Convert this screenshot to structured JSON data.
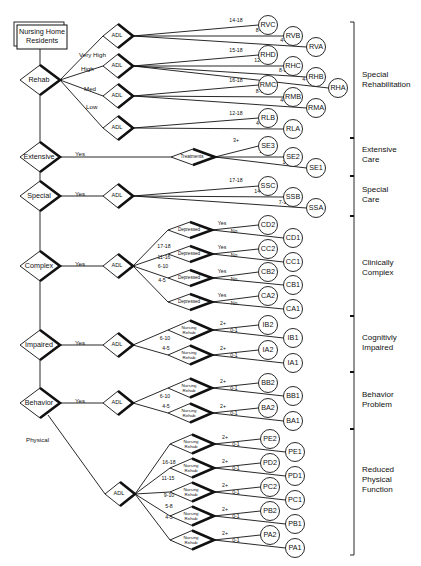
{
  "title_lines": [
    "Nursing Home",
    "Residents"
  ],
  "colors": {
    "line": "#111111",
    "background": "#ffffff"
  },
  "main_nodes": [
    {
      "id": "rehab",
      "label": "Rehab",
      "x": 40,
      "y": 80
    },
    {
      "id": "extensive",
      "label": "Extensive",
      "x": 40,
      "y": 157
    },
    {
      "id": "special",
      "label": "Special",
      "x": 40,
      "y": 196
    },
    {
      "id": "complex",
      "label": "Complex",
      "x": 40,
      "y": 266
    },
    {
      "id": "impaired",
      "label": "Impaired",
      "x": 40,
      "y": 345
    },
    {
      "id": "behavior",
      "label": "Behavior",
      "x": 40,
      "y": 403
    }
  ],
  "edge_labels": [
    {
      "text": "Very High",
      "x": 79,
      "y": 55
    },
    {
      "text": "High",
      "x": 81,
      "y": 69
    },
    {
      "text": "Med",
      "x": 84,
      "y": 89
    },
    {
      "text": "Low",
      "x": 86,
      "y": 107
    },
    {
      "text": "Yes",
      "x": 75,
      "y": 154
    },
    {
      "text": "Yes",
      "x": 75,
      "y": 194
    },
    {
      "text": "Yes",
      "x": 75,
      "y": 264
    },
    {
      "text": "Yes",
      "x": 75,
      "y": 343
    },
    {
      "text": "Yes",
      "x": 75,
      "y": 401
    },
    {
      "text": "Physical",
      "x": 26,
      "y": 440
    }
  ],
  "adl_nodes": [
    {
      "label": "ADL",
      "x": 118,
      "y": 36
    },
    {
      "label": "ADL",
      "x": 118,
      "y": 66
    },
    {
      "label": "ADL",
      "x": 118,
      "y": 96
    },
    {
      "label": "ADL",
      "x": 118,
      "y": 128
    },
    {
      "label": "ADL",
      "x": 118,
      "y": 196
    },
    {
      "label": "ADL",
      "x": 118,
      "y": 266
    },
    {
      "label": "ADL",
      "x": 118,
      "y": 345
    },
    {
      "label": "ADL",
      "x": 118,
      "y": 403
    },
    {
      "label": "ADL",
      "x": 120,
      "y": 494
    }
  ],
  "rehab_groups": [
    {
      "adl": 0,
      "outcomes": [
        {
          "code": "RVC",
          "range": "14-18",
          "x": 268,
          "y": 25
        },
        {
          "code": "RVB",
          "range": "8-13",
          "x": 293,
          "y": 36
        },
        {
          "code": "RVA",
          "range": "4-7",
          "x": 316,
          "y": 47
        }
      ]
    },
    {
      "adl": 1,
      "outcomes": [
        {
          "code": "RHD",
          "range": "15-18",
          "x": 268,
          "y": 55
        },
        {
          "code": "RHC",
          "range": "12-14",
          "x": 293,
          "y": 66
        },
        {
          "code": "RHB",
          "range": "8-11",
          "x": 316,
          "y": 77
        },
        {
          "code": "RHA",
          "range": "4-7",
          "x": 338,
          "y": 88
        }
      ]
    },
    {
      "adl": 2,
      "outcomes": [
        {
          "code": "RMC",
          "range": "16-18",
          "x": 268,
          "y": 85
        },
        {
          "code": "RMB",
          "range": "8-15",
          "x": 293,
          "y": 97
        },
        {
          "code": "RMA",
          "range": "4-7",
          "x": 316,
          "y": 108
        }
      ]
    },
    {
      "adl": 3,
      "outcomes": [
        {
          "code": "RLB",
          "range": "12-18",
          "x": 268,
          "y": 118
        },
        {
          "code": "RLA",
          "range": "4-11",
          "x": 293,
          "y": 129
        }
      ]
    }
  ],
  "extensive": {
    "node": {
      "label": "Treatments",
      "x": 193,
      "y": 157
    },
    "outcomes": [
      {
        "code": "SE3",
        "range": "3+",
        "x": 268,
        "y": 146
      },
      {
        "code": "SE2",
        "range": "2",
        "x": 293,
        "y": 157
      },
      {
        "code": "SE1",
        "range": "1",
        "x": 316,
        "y": 168
      }
    ]
  },
  "special": {
    "outcomes": [
      {
        "code": "SSC",
        "range": "17-18",
        "x": 268,
        "y": 186
      },
      {
        "code": "SSB",
        "range": "14-16",
        "x": 293,
        "y": 197
      },
      {
        "code": "SSA",
        "range": "7-13",
        "x": 316,
        "y": 208
      }
    ]
  },
  "complex": {
    "branches": [
      {
        "range": "17-18",
        "node": "Depressed",
        "x": 190,
        "y": 230,
        "yes": {
          "code": "CD2",
          "x": 268,
          "y": 225
        },
        "no": {
          "code": "CD1",
          "x": 293,
          "y": 238
        }
      },
      {
        "range": "11-16",
        "node": "Depressed",
        "x": 190,
        "y": 254,
        "yes": {
          "code": "CC2",
          "x": 268,
          "y": 249
        },
        "no": {
          "code": "CC1",
          "x": 293,
          "y": 262
        }
      },
      {
        "range": "6-10",
        "node": "Depressed",
        "x": 190,
        "y": 278,
        "yes": {
          "code": "CB2",
          "x": 268,
          "y": 272
        },
        "no": {
          "code": "CB1",
          "x": 293,
          "y": 285
        }
      },
      {
        "range": "4-5",
        "node": "Depressed",
        "x": 190,
        "y": 302,
        "yes": {
          "code": "CA2",
          "x": 268,
          "y": 296
        },
        "no": {
          "code": "CA1",
          "x": 293,
          "y": 309
        }
      }
    ],
    "yes_label": "Yes",
    "no_label": "No"
  },
  "impaired": {
    "branches": [
      {
        "range": "6-10",
        "node": [
          "Nursing",
          "Rehab"
        ],
        "x": 190,
        "y": 330,
        "hi": {
          "code": "IB2",
          "label": "2+",
          "x": 268,
          "y": 325
        },
        "lo": {
          "code": "IB1",
          "label": "0-1",
          "x": 293,
          "y": 338
        }
      },
      {
        "range": "4-5",
        "node": [
          "Nursing",
          "Rehab"
        ],
        "x": 190,
        "y": 355,
        "hi": {
          "code": "IA2",
          "label": "2+",
          "x": 268,
          "y": 350
        },
        "lo": {
          "code": "IA1",
          "label": "0-1",
          "x": 293,
          "y": 363
        }
      }
    ]
  },
  "behavior": {
    "branches": [
      {
        "range": "6-10",
        "node": [
          "Nursing",
          "Rehab"
        ],
        "x": 190,
        "y": 388,
        "hi": {
          "code": "BB2",
          "label": "2+",
          "x": 268,
          "y": 383
        },
        "lo": {
          "code": "BB1",
          "label": "0-1",
          "x": 293,
          "y": 396
        }
      },
      {
        "range": "4-5",
        "node": [
          "Nursing",
          "Rehab"
        ],
        "x": 190,
        "y": 413,
        "hi": {
          "code": "BA2",
          "label": "2+",
          "x": 268,
          "y": 408
        },
        "lo": {
          "code": "BA1",
          "label": "0-1",
          "x": 293,
          "y": 421
        }
      }
    ]
  },
  "physical": {
    "branches": [
      {
        "range": "",
        "node": [
          "Nursing",
          "Rehab"
        ],
        "x": 192,
        "y": 444,
        "hi": {
          "code": "PE2",
          "label": "2+",
          "x": 270,
          "y": 439
        },
        "lo": {
          "code": "PE1",
          "label": "0-1",
          "x": 295,
          "y": 452
        }
      },
      {
        "range": "16-18",
        "node": [
          "Nursing",
          "Rehab"
        ],
        "x": 192,
        "y": 468,
        "hi": {
          "code": "PD2",
          "label": "2+",
          "x": 270,
          "y": 463
        },
        "lo": {
          "code": "PD1",
          "label": "0-1",
          "x": 295,
          "y": 476
        }
      },
      {
        "range": "11-15",
        "node": [
          "Nursing",
          "Rehab"
        ],
        "x": 192,
        "y": 492,
        "hi": {
          "code": "PC2",
          "label": "2+",
          "x": 270,
          "y": 487
        },
        "lo": {
          "code": "PC1",
          "label": "0-1",
          "x": 295,
          "y": 500
        }
      },
      {
        "range": "9-10",
        "node": [
          "Nursing",
          "Rehab"
        ],
        "x": 192,
        "y": 516,
        "hi": {
          "code": "PB2",
          "label": "2+",
          "x": 270,
          "y": 511
        },
        "lo": {
          "code": "PB1",
          "label": "0-1",
          "x": 295,
          "y": 524
        }
      },
      {
        "range": "5-8",
        "node": [
          "Nursing",
          "Rehab"
        ],
        "x": 192,
        "y": 540,
        "hi": {
          "code": "PA2",
          "label": "2+",
          "x": 270,
          "y": 535
        },
        "lo": {
          "code": "PA1",
          "label": "0-1",
          "x": 295,
          "y": 548
        }
      }
    ],
    "extra_range": "4-5"
  },
  "categories": [
    {
      "lines": [
        "Special",
        "Rehabilitation"
      ],
      "top": 22,
      "bottom": 138,
      "label_y": 80
    },
    {
      "lines": [
        "Extensive",
        "Care"
      ],
      "top": 138,
      "bottom": 176,
      "label_y": 155
    },
    {
      "lines": [
        "Special",
        "Care"
      ],
      "top": 176,
      "bottom": 216,
      "label_y": 195
    },
    {
      "lines": [
        "Clinically",
        "Complex"
      ],
      "top": 216,
      "bottom": 316,
      "label_y": 268
    },
    {
      "lines": [
        "Cognitivly",
        "Impaired"
      ],
      "top": 316,
      "bottom": 372,
      "label_y": 343
    },
    {
      "lines": [
        "Behavior",
        "Problem"
      ],
      "top": 372,
      "bottom": 429,
      "label_y": 400
    },
    {
      "lines": [
        "Reduced",
        "Physical",
        "Function"
      ],
      "top": 429,
      "bottom": 555,
      "label_y": 480
    }
  ]
}
